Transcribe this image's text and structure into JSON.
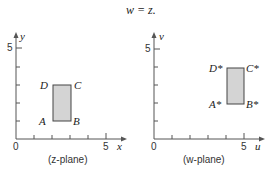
{
  "title": "w = z.",
  "colors": {
    "axis": "#555555",
    "fill": "#d4d4d4",
    "stroke": "#444444"
  },
  "plots": [
    {
      "caption": "(z-plane)",
      "x_label": "x",
      "y_label": "y",
      "origin_label": "0",
      "x_tick_label": "5",
      "y_tick_label": "5",
      "rect": {
        "x": [
          2,
          3
        ],
        "y": [
          1,
          3
        ]
      },
      "corners": {
        "A": "A",
        "B": "B",
        "C": "C",
        "D": "D"
      }
    },
    {
      "caption": "(w-plane)",
      "x_label": "u",
      "y_label": "v",
      "origin_label": "0",
      "x_tick_label": "5",
      "y_tick_label": "5",
      "rect": {
        "x": [
          4,
          5
        ],
        "y": [
          2,
          4
        ]
      },
      "corners": {
        "A": "A*",
        "B": "B*",
        "C": "C*",
        "D": "D*"
      }
    }
  ]
}
